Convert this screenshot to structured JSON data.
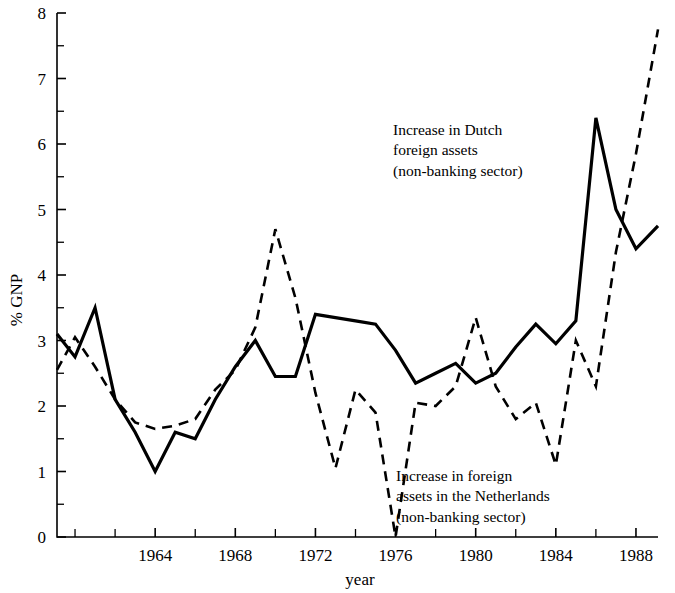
{
  "axes": {
    "ylabel": "% GNP",
    "xlabel": "year",
    "y_ticks": [
      "0",
      "1",
      "2",
      "3",
      "4",
      "5",
      "6",
      "7",
      "8"
    ],
    "x_ticks": [
      "1964",
      "1968",
      "1972",
      "1976",
      "1980",
      "1984",
      "1988"
    ]
  },
  "annotations": {
    "dutch_assets": {
      "line1": "Increase in Dutch",
      "line2": "foreign assets",
      "line3": "(non-banking sector)"
    },
    "foreign_assets": {
      "line1": "Increase in foreign",
      "line2": "assets in the Netherlands",
      "line3": "(non-banking sector)"
    }
  },
  "chart_data": {
    "type": "line",
    "title": "",
    "xlabel": "year",
    "ylabel": "% GNP",
    "xlim": [
      1959.1,
      1989.1
    ],
    "ylim": [
      0,
      8
    ],
    "x_tick_values": [
      1964,
      1968,
      1972,
      1976,
      1980,
      1984,
      1988
    ],
    "x_minor_tick_interval": 2,
    "y_tick_values": [
      0,
      1,
      2,
      3,
      4,
      5,
      6,
      7,
      8
    ],
    "y_minor_tick_interval": 0.5,
    "grid": false,
    "legend_position": "inline-annotations",
    "series": [
      {
        "name": "Increase in Dutch foreign assets (non-banking sector)",
        "style": "solid",
        "color": "#000000",
        "x": [
          1959.1,
          1960,
          1961,
          1962,
          1963,
          1964,
          1965,
          1966,
          1967,
          1968,
          1969,
          1970,
          1971,
          1972,
          1973,
          1974,
          1975,
          1976,
          1977,
          1978,
          1979,
          1980,
          1981,
          1982,
          1983,
          1984,
          1985,
          1986,
          1987,
          1988,
          1989.1
        ],
        "values": [
          3.1,
          2.75,
          3.5,
          2.1,
          1.6,
          1.0,
          1.6,
          1.5,
          2.1,
          2.6,
          3.0,
          2.45,
          2.45,
          3.4,
          3.35,
          3.3,
          3.25,
          2.85,
          2.35,
          2.5,
          2.65,
          2.35,
          2.5,
          2.9,
          3.25,
          2.95,
          3.3,
          6.4,
          5.0,
          4.4,
          4.75
        ]
      },
      {
        "name": "Increase in foreign assets in the Netherlands (non-banking sector)",
        "style": "dashed",
        "color": "#000000",
        "x": [
          1959.1,
          1960,
          1961,
          1962,
          1963,
          1964,
          1965,
          1966,
          1967,
          1968,
          1969,
          1970,
          1971,
          1972,
          1973,
          1974,
          1975,
          1976,
          1977,
          1978,
          1979,
          1980,
          1981,
          1982,
          1983,
          1984,
          1985,
          1986,
          1987,
          1988,
          1989.1
        ],
        "values": [
          2.55,
          3.05,
          2.6,
          2.1,
          1.75,
          1.65,
          1.7,
          1.8,
          2.25,
          2.55,
          3.2,
          4.7,
          3.65,
          2.2,
          1.05,
          2.25,
          1.9,
          0.0,
          2.05,
          2.0,
          2.3,
          3.35,
          2.3,
          1.8,
          2.05,
          1.1,
          3.0,
          2.3,
          4.35,
          5.85,
          7.75
        ]
      }
    ]
  }
}
